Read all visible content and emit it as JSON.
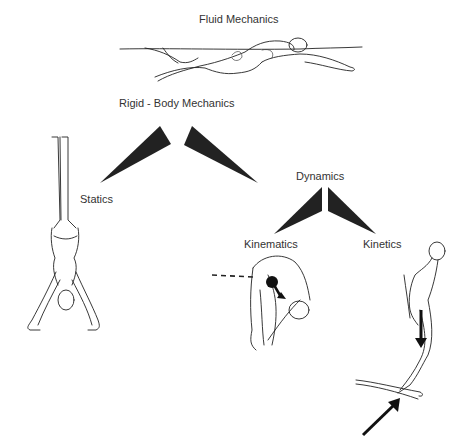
{
  "diagram": {
    "labels": {
      "fluid": "Fluid Mechanics",
      "rigid": "Rigid - Body Mechanics",
      "statics": "Statics",
      "dynamics": "Dynamics",
      "kinematics": "Kinematics",
      "kinetics": "Kinetics"
    },
    "nodes": [
      {
        "id": "fluid",
        "label": "Fluid Mechanics",
        "illustration": "swimmer"
      },
      {
        "id": "rigid",
        "label": "Rigid - Body Mechanics"
      },
      {
        "id": "statics",
        "label": "Statics",
        "parent": "rigid",
        "illustration": "handstand"
      },
      {
        "id": "dynamics",
        "label": "Dynamics",
        "parent": "rigid"
      },
      {
        "id": "kinematics",
        "label": "Kinematics",
        "parent": "dynamics",
        "illustration": "tucked-diver-with-trajectory"
      },
      {
        "id": "kinetics",
        "label": "Kinetics",
        "parent": "dynamics",
        "illustration": "diver-on-springboard-with-force-arrows"
      }
    ],
    "colors": {
      "connector": "#222222",
      "text": "#333333",
      "background": "#ffffff"
    }
  }
}
